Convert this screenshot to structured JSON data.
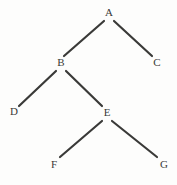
{
  "diagram": {
    "kind": "tree-diagram",
    "title": "",
    "canvas": {
      "width": 177,
      "height": 185,
      "background": "#fdfdfc"
    },
    "style": {
      "edge_color": "#3a3a38",
      "edge_width": 2.2,
      "label_color": "#3a3a38",
      "label_font_size": 11
    },
    "nodes": [
      {
        "id": "A",
        "label": "A",
        "x": 109,
        "y": 12
      },
      {
        "id": "B",
        "label": "B",
        "x": 61,
        "y": 62
      },
      {
        "id": "C",
        "label": "C",
        "x": 157,
        "y": 62
      },
      {
        "id": "D",
        "label": "D",
        "x": 14,
        "y": 111
      },
      {
        "id": "E",
        "label": "E",
        "x": 107,
        "y": 112
      },
      {
        "id": "F",
        "label": "F",
        "x": 54,
        "y": 164
      },
      {
        "id": "G",
        "label": "G",
        "x": 164,
        "y": 164
      }
    ],
    "edges": [
      {
        "id": "A-B",
        "from": "A",
        "to": "B",
        "x1": 104,
        "y1": 21,
        "x2": 64,
        "y2": 56
      },
      {
        "id": "A-C",
        "from": "A",
        "to": "C",
        "x1": 114,
        "y1": 21,
        "x2": 152,
        "y2": 56
      },
      {
        "id": "B-D",
        "from": "B",
        "to": "D",
        "x1": 56,
        "y1": 71,
        "x2": 19,
        "y2": 106
      },
      {
        "id": "B-E",
        "from": "B",
        "to": "E",
        "x1": 66,
        "y1": 71,
        "x2": 102,
        "y2": 106
      },
      {
        "id": "E-F",
        "from": "E",
        "to": "F",
        "x1": 102,
        "y1": 121,
        "x2": 60,
        "y2": 157
      },
      {
        "id": "E-G",
        "from": "E",
        "to": "G",
        "x1": 112,
        "y1": 121,
        "x2": 157,
        "y2": 157
      }
    ]
  }
}
